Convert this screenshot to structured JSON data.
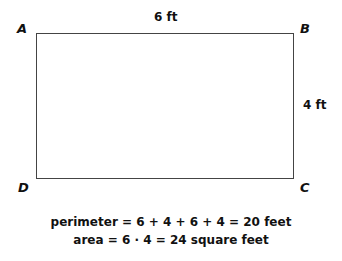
{
  "diagram": {
    "vertices": {
      "A": "A",
      "B": "B",
      "C": "C",
      "D": "D"
    },
    "dimensions": {
      "top": "6 ft",
      "right": "4 ft"
    },
    "equations": {
      "perimeter": "perimeter = 6 + 4 + 6 + 4 = 20 feet",
      "area": "area = 6 · 4 = 24 square feet"
    },
    "colors": {
      "stroke": "#444444",
      "text": "#111111",
      "background": "#ffffff"
    }
  }
}
